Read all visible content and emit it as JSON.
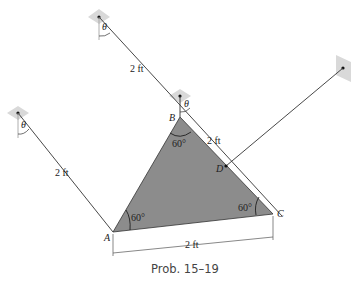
{
  "figure": {
    "caption": "Prob. 15–19",
    "colors": {
      "plate": "#8c8c8c",
      "support": "#d9d9d9",
      "line": "#333333"
    },
    "points": {
      "A": "A",
      "B": "B",
      "C": "C",
      "D": "D"
    },
    "angles": {
      "at_A": "60°",
      "at_B": "60°",
      "at_C": "60°",
      "theta": "θ"
    },
    "dimensions": {
      "left_cable": "2 ft",
      "top_cable": "2 ft",
      "BC_cable": "2 ft",
      "base": "2 ft"
    }
  }
}
